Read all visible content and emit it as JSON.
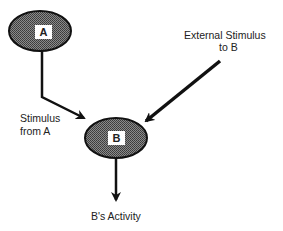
{
  "diagram": {
    "nodes": {
      "a": {
        "label": "A"
      },
      "b": {
        "label": "B"
      }
    },
    "labels": {
      "external_line1": "External Stimulus",
      "external_line2": "to B",
      "stimulus_line1": "Stimulus",
      "stimulus_line2": "from A",
      "activity": "B's Activity"
    },
    "colors": {
      "node_fill": "#6e6e6e",
      "stroke": "#111111",
      "label_box": "#ffffff"
    }
  }
}
